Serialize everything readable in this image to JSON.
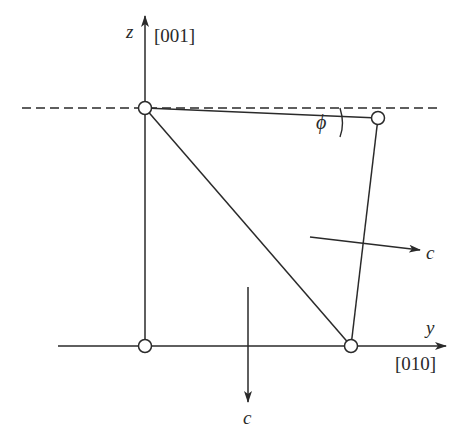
{
  "diagram": {
    "axes": {
      "vertical": {
        "name": "z",
        "direction": "[001]"
      },
      "horizontal": {
        "name": "y",
        "direction": "[010]"
      }
    },
    "angle_label": "ϕ",
    "vector_labels": {
      "right_arrow": "c",
      "down_arrow": "c"
    },
    "colors": {
      "line": "#2a2a2a",
      "background": "#ffffff"
    }
  }
}
